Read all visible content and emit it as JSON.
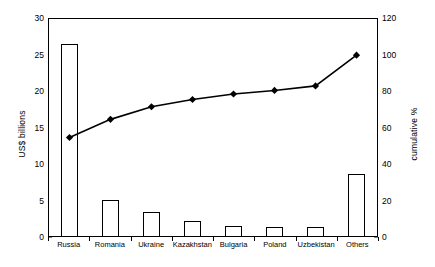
{
  "chart_data": {
    "type": "bar",
    "title": "",
    "subtitle": "",
    "categories": [
      "Russia",
      "Romania",
      "Ukraine",
      "Kazakhstan",
      "Bulgaria",
      "Poland",
      "Uzbekistan",
      "Others"
    ],
    "series": [
      {
        "name": "US$ billions",
        "type": "bar",
        "axis": "left",
        "values": [
          26.3,
          4.9,
          3.3,
          2.1,
          1.4,
          1.3,
          1.2,
          8.5
        ]
      },
      {
        "name": "cumulative %",
        "type": "line",
        "axis": "right",
        "marker": "diamond",
        "values": [
          54.5,
          64.5,
          71.5,
          75.5,
          78.5,
          80.5,
          83.0,
          100.0
        ]
      }
    ],
    "xlabel": "",
    "ylabel": "US$ billions",
    "y2label": "cumulative %",
    "ylim": [
      0,
      30
    ],
    "y2lim": [
      0,
      120
    ],
    "yticks": [
      0,
      5,
      10,
      15,
      20,
      25,
      30
    ],
    "y2ticks": [
      0,
      20,
      40,
      60,
      80,
      100,
      120
    ],
    "ytick_labels": [
      "0",
      "5",
      "10",
      "15",
      "20",
      "25",
      "30"
    ],
    "y2tick_labels": [
      "0",
      "20",
      "40",
      "60",
      "80",
      "100",
      "120"
    ],
    "grid": false,
    "legend": "none",
    "line_color": "#000000",
    "bar_fill": "#ffffff",
    "bar_edge": "#000000",
    "background": "#ffffff"
  }
}
